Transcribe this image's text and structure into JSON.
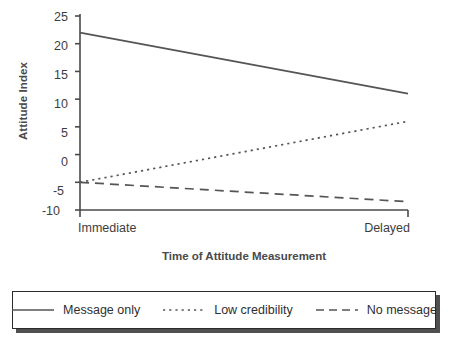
{
  "chart_data": {
    "type": "line",
    "title": "",
    "xlabel": "Time of Attitude Measurement",
    "ylabel": "Attitude Index",
    "categories": [
      "Immediate",
      "Delayed"
    ],
    "x": [
      0,
      1
    ],
    "xlim": [
      0,
      1
    ],
    "ylim": [
      -10,
      25
    ],
    "yticks": [
      25,
      20,
      15,
      10,
      5,
      0,
      -5,
      -10
    ],
    "ytick_labels": [
      "25",
      "20",
      "15",
      "10",
      "5",
      "0",
      "-5",
      "-10"
    ],
    "grid": false,
    "legend_position": "bottom",
    "series": [
      {
        "name": "Message only",
        "style": "solid",
        "color": "#555555",
        "values": [
          22,
          11
        ]
      },
      {
        "name": "Low credibility",
        "style": "dotted",
        "color": "#555555",
        "values": [
          -5,
          6
        ]
      },
      {
        "name": "No message",
        "style": "dashed",
        "color": "#555555",
        "values": [
          -5,
          -8.5
        ]
      }
    ]
  },
  "axes": {
    "ylabel": "Attitude Index",
    "xlabel": "Time of Attitude Measurement",
    "ytick_labels": [
      "25",
      "20",
      "15",
      "10",
      "5",
      "0",
      "-5",
      "-10"
    ],
    "xtick_left": "Immediate",
    "xtick_right": "Delayed",
    "axis_color": "#4a4a4a"
  },
  "legend": {
    "entries": [
      {
        "label": "Message only",
        "icon": "solid-line-swatch"
      },
      {
        "label": "Low credibility",
        "icon": "dotted-line-swatch"
      },
      {
        "label": "No message",
        "icon": "dashed-line-swatch"
      }
    ]
  }
}
